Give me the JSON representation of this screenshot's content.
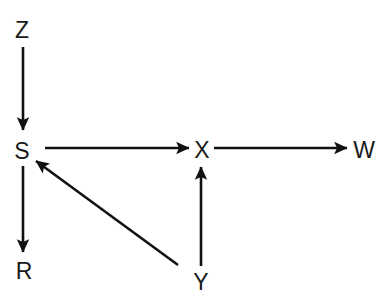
{
  "diagram": {
    "background_color": "#ffffff",
    "stroke_color": "#111111",
    "text_color": "#1a1a1a",
    "nodes": [
      {
        "id": "Z",
        "label": "Z",
        "x": 22,
        "y": 30
      },
      {
        "id": "S",
        "label": "S",
        "x": 22,
        "y": 151
      },
      {
        "id": "R",
        "label": "R",
        "x": 24,
        "y": 271
      },
      {
        "id": "X",
        "label": "X",
        "x": 202,
        "y": 150
      },
      {
        "id": "W",
        "label": "W",
        "x": 364,
        "y": 150
      },
      {
        "id": "Y",
        "label": "Y",
        "x": 201,
        "y": 282
      }
    ],
    "edges": [
      {
        "id": "z-to-s",
        "from": "Z",
        "to": "S",
        "x1": 23,
        "y1": 47,
        "x2": 23,
        "y2": 130,
        "direction": "down"
      },
      {
        "id": "s-to-r",
        "from": "S",
        "to": "R",
        "x1": 23,
        "y1": 166,
        "x2": 23,
        "y2": 252,
        "direction": "down"
      },
      {
        "id": "s-to-x",
        "from": "S",
        "to": "X",
        "x1": 45,
        "y1": 148,
        "x2": 189,
        "y2": 148,
        "direction": "right"
      },
      {
        "id": "x-to-w",
        "from": "X",
        "to": "W",
        "x1": 214,
        "y1": 148,
        "x2": 347,
        "y2": 148,
        "direction": "right"
      },
      {
        "id": "y-to-x",
        "from": "Y",
        "to": "X",
        "x1": 201,
        "y1": 266,
        "x2": 201,
        "y2": 167,
        "direction": "up"
      },
      {
        "id": "y-to-s",
        "from": "Y",
        "to": "S",
        "x1": 178,
        "y1": 265,
        "x2": 36,
        "y2": 161,
        "direction": "diagonal-up-left"
      }
    ]
  }
}
